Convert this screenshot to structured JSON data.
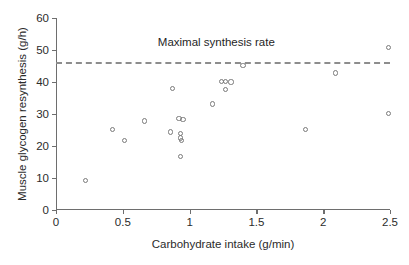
{
  "chart_data": {
    "type": "scatter",
    "title": "",
    "xlabel": "Carbohydrate intake (g/min)",
    "ylabel": "Muscle glycogen resynthesis (g/h)",
    "xlim": [
      0,
      2.5
    ],
    "ylim": [
      0,
      60
    ],
    "xticks": [
      0,
      0.5,
      1,
      1.5,
      2,
      2.5
    ],
    "xtick_labels": [
      "0",
      "0.5",
      "1",
      "1.5",
      "2",
      "2.5"
    ],
    "yticks": [
      0,
      10,
      20,
      30,
      40,
      50,
      60
    ],
    "ytick_labels": [
      "0",
      "10",
      "20",
      "30",
      "40",
      "50",
      "60"
    ],
    "grid": false,
    "legend": null,
    "marker": "open-circle",
    "marker_color": "#7a7a7a",
    "points": [
      {
        "x": 0.22,
        "y": 9.1
      },
      {
        "x": 0.42,
        "y": 25.1
      },
      {
        "x": 0.51,
        "y": 21.8
      },
      {
        "x": 0.66,
        "y": 27.8
      },
      {
        "x": 0.86,
        "y": 24.4
      },
      {
        "x": 0.87,
        "y": 37.9
      },
      {
        "x": 0.92,
        "y": 28.6
      },
      {
        "x": 0.95,
        "y": 28.3
      },
      {
        "x": 0.93,
        "y": 23.8
      },
      {
        "x": 0.93,
        "y": 22.5
      },
      {
        "x": 0.94,
        "y": 21.6
      },
      {
        "x": 0.93,
        "y": 16.6
      },
      {
        "x": 1.17,
        "y": 33.1
      },
      {
        "x": 1.24,
        "y": 40.1
      },
      {
        "x": 1.27,
        "y": 40.1
      },
      {
        "x": 1.27,
        "y": 37.7
      },
      {
        "x": 1.31,
        "y": 40.0
      },
      {
        "x": 1.4,
        "y": 45.1
      },
      {
        "x": 1.87,
        "y": 25.2
      },
      {
        "x": 2.09,
        "y": 42.8
      },
      {
        "x": 2.49,
        "y": 50.7
      },
      {
        "x": 2.49,
        "y": 30.1
      }
    ],
    "annotations": [
      {
        "name": "maximal-synthesis-rate",
        "text": "Maximal synthesis rate",
        "type": "hline-with-label",
        "y": 46.4,
        "label_x": 1.2,
        "label_y": 50.5,
        "line_style": "dashed",
        "line_color": "#8d8d8d",
        "x_start": 0.0,
        "x_end": 2.5
      }
    ]
  }
}
